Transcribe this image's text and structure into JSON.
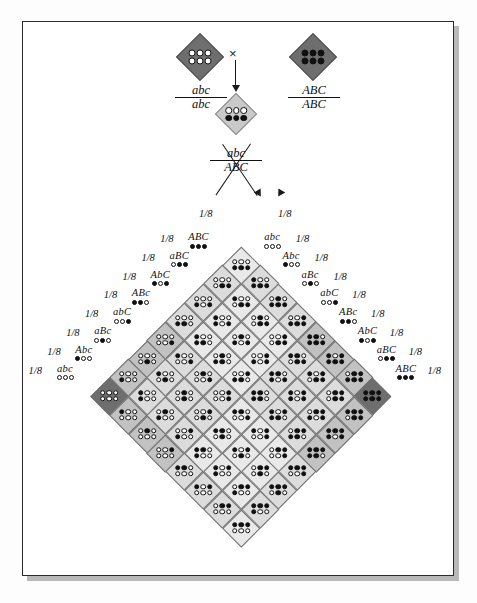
{
  "figure": {
    "cross_symbol": "×",
    "parents": [
      {
        "label_numerator": "abc",
        "label_denominator": "abc",
        "genotype": "abc/abc",
        "chip_fill": "#6e6e6e",
        "top_row": [
          "white",
          "white",
          "white"
        ],
        "bottom_row": [
          "white",
          "white",
          "white"
        ]
      },
      {
        "label_numerator": "ABC",
        "label_denominator": "ABC",
        "genotype": "ABC/ABC",
        "chip_fill": "#6e6e6e",
        "top_row": [
          "black",
          "black",
          "black"
        ],
        "bottom_row": [
          "black",
          "black",
          "black"
        ]
      }
    ],
    "f1": {
      "label_numerator": "abc",
      "label_denominator": "ABC",
      "genotype": "abc/ABC",
      "chip_fill": "#c9c9c9",
      "top_row": [
        "white",
        "white",
        "white"
      ],
      "bottom_row": [
        "black",
        "black",
        "black"
      ]
    },
    "gamete_frequency": "1/8"
  },
  "chart_data": {
    "type": "table",
    "grid_size": 8,
    "row_gametes": [
      "ABC",
      "aBC",
      "AbC",
      "ABc",
      "abC",
      "aBc",
      "Abc",
      "abc"
    ],
    "col_gametes": [
      "abc",
      "Abc",
      "aBc",
      "abC",
      "ABc",
      "AbC",
      "aBC",
      "ABC"
    ],
    "row_frequencies": [
      "1/8",
      "1/8",
      "1/8",
      "1/8",
      "1/8",
      "1/8",
      "1/8",
      "1/8"
    ],
    "col_frequencies": [
      "1/8",
      "1/8",
      "1/8",
      "1/8",
      "1/8",
      "1/8",
      "1/8",
      "1/8"
    ],
    "allele_dominant_char": "uppercase",
    "shade_scale": [
      "#6e6e6e",
      "#8f8f8f",
      "#a3a3a3",
      "#b4b4b4",
      "#c2c2c2",
      "#cfcfcf",
      "#dcdcdc",
      "#e9e9e9"
    ]
  }
}
